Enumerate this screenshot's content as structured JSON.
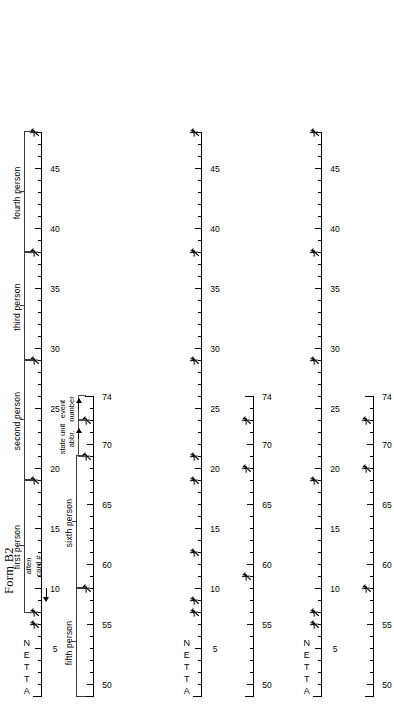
{
  "document": {
    "title": "Form B2"
  },
  "axis_labels": {
    "atten": [
      "A",
      "T",
      "T",
      "E",
      "N"
    ]
  },
  "rulers": {
    "top": {
      "name": "main-scale-1-48",
      "min": 1,
      "max": 48,
      "tick_numbers": [
        5,
        10,
        15,
        20,
        25,
        30,
        35,
        40,
        45
      ],
      "label_text": {
        "n5": "5",
        "n10": "10",
        "n15": "15",
        "n20": "20",
        "n25": "25",
        "n30": "30",
        "n35": "35",
        "n40": "40",
        "n45": "45"
      }
    },
    "bottom": {
      "name": "main-scale-49-74",
      "min": 49,
      "max": 74,
      "tick_numbers": [
        50,
        55,
        60,
        65,
        70,
        74
      ],
      "label_text": {
        "n50": "50",
        "n55": "55",
        "n60": "60",
        "n65": "65",
        "n70": "70",
        "n74": "74"
      }
    }
  },
  "annotations": {
    "atten_card": {
      "line1": "atten",
      "line2": "card #"
    },
    "state_unit": {
      "line1": "state unit",
      "line2": "abbr."
    },
    "event_number": {
      "line1": "event",
      "line2": "number"
    }
  },
  "person_brackets": {
    "first": "first person",
    "second": "second person",
    "third": "third person",
    "fourth": "fourth person",
    "fifth": "fifth person",
    "sixth": "sixth person"
  },
  "marks": {
    "column1_top": [
      7,
      8,
      19,
      29,
      38,
      48
    ],
    "column1_bottom": [
      58,
      69,
      72
    ],
    "column2_top": [
      8,
      9,
      13,
      19,
      21,
      29,
      38,
      48
    ],
    "column2_bottom": [
      59,
      68,
      72
    ],
    "column3_top": [
      7,
      8,
      19,
      29,
      38,
      48
    ],
    "column3_bottom": [
      58,
      68,
      72
    ]
  },
  "chart_data": {
    "type": "table",
    "title": "Form B2",
    "columns": 3,
    "scales": [
      {
        "id": "upper",
        "range": [
          1,
          48
        ],
        "labeled_ticks": [
          5,
          10,
          15,
          20,
          25,
          30,
          35,
          40,
          45
        ]
      },
      {
        "id": "lower",
        "range": [
          49,
          74
        ],
        "labeled_ticks": [
          50,
          55,
          60,
          65,
          70,
          74
        ]
      }
    ],
    "field_groups": [
      {
        "label": "atten card #",
        "scale": "upper",
        "start": 1,
        "end": 8
      },
      {
        "label": "first person",
        "scale": "upper",
        "start": 8,
        "end": 19
      },
      {
        "label": "second person",
        "scale": "upper",
        "start": 19,
        "end": 29
      },
      {
        "label": "third person",
        "scale": "upper",
        "start": 29,
        "end": 38
      },
      {
        "label": "fourth person",
        "scale": "upper",
        "start": 38,
        "end": 48
      },
      {
        "label": "fifth person",
        "scale": "lower",
        "start": 49,
        "end": 58
      },
      {
        "label": "sixth person",
        "scale": "lower",
        "start": 58,
        "end": 69
      },
      {
        "label": "state unit abbr.",
        "scale": "lower",
        "start": 69,
        "end": 72
      },
      {
        "label": "event number",
        "scale": "lower",
        "start": 72,
        "end": 74
      }
    ]
  }
}
